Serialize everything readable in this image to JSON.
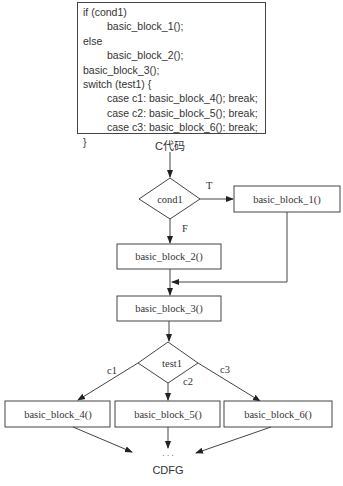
{
  "code": {
    "lines": [
      {
        "text": "if (cond1)",
        "indent": false
      },
      {
        "text": "basic_block_1();",
        "indent": true
      },
      {
        "text": "else",
        "indent": false
      },
      {
        "text": "basic_block_2();",
        "indent": true
      },
      {
        "text": "basic_block_3();",
        "indent": false
      },
      {
        "text": "switch (test1) {",
        "indent": false
      },
      {
        "text": "case c1: basic_block_4(); break;",
        "indent": true
      },
      {
        "text": "case c2: basic_block_5(); break;",
        "indent": true
      },
      {
        "text": "case c3: basic_block_6(): break;",
        "indent": true
      },
      {
        "text": "}",
        "indent": false
      }
    ],
    "caption": "C代码"
  },
  "cdfg": {
    "caption": "CDFG",
    "ellipsis": "· · ·",
    "decisions": {
      "cond1": {
        "label": "cond1",
        "true_label": "T",
        "false_label": "F"
      },
      "test1": {
        "label": "test1",
        "branch_labels": [
          "c1",
          "c2",
          "c3"
        ]
      }
    },
    "blocks": {
      "bb1": "basic_block_1()",
      "bb2": "basic_block_2()",
      "bb3": "basic_block_3()",
      "bb4": "basic_block_4()",
      "bb5": "basic_block_5()",
      "bb6": "basic_block_6()"
    },
    "colors": {
      "stroke": "#444444",
      "text": "#333333",
      "background": "#ffffff"
    }
  }
}
